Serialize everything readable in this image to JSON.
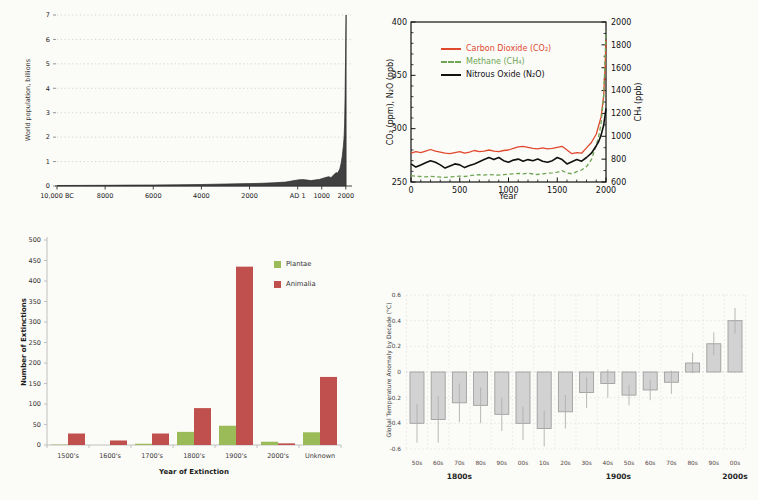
{
  "page_background": "#fbfbf8",
  "chart_data": [
    {
      "id": "population",
      "type": "area",
      "title": "",
      "ylabel": "World population, billions",
      "yticks": [
        0,
        1,
        2,
        3,
        4,
        5,
        6,
        7
      ],
      "ylim": [
        0,
        7
      ],
      "xlim": [
        -10000,
        2050
      ],
      "grid": "horizontal-dotted",
      "area_color": "#404040",
      "xticks": [
        {
          "year": -10000,
          "label": "10,000 BC"
        },
        {
          "year": -8000,
          "label": "8000"
        },
        {
          "year": -6000,
          "label": "6000"
        },
        {
          "year": -4000,
          "label": "4000"
        },
        {
          "year": -2000,
          "label": "2000"
        },
        {
          "year": 1,
          "label": "AD 1"
        },
        {
          "year": 1000,
          "label": "1000"
        },
        {
          "year": 2000,
          "label": "2000"
        }
      ],
      "points": [
        [
          -10000,
          0.02
        ],
        [
          -9000,
          0.025
        ],
        [
          -8000,
          0.03
        ],
        [
          -7000,
          0.035
        ],
        [
          -6000,
          0.04
        ],
        [
          -5000,
          0.05
        ],
        [
          -4000,
          0.06
        ],
        [
          -3000,
          0.08
        ],
        [
          -2000,
          0.1
        ],
        [
          -1500,
          0.11
        ],
        [
          -1000,
          0.13
        ],
        [
          -500,
          0.16
        ],
        [
          1,
          0.25
        ],
        [
          200,
          0.26
        ],
        [
          400,
          0.24
        ],
        [
          541,
          0.22
        ],
        [
          700,
          0.24
        ],
        [
          900,
          0.27
        ],
        [
          1000,
          0.3
        ],
        [
          1100,
          0.33
        ],
        [
          1200,
          0.36
        ],
        [
          1300,
          0.38
        ],
        [
          1350,
          0.35
        ],
        [
          1400,
          0.36
        ],
        [
          1500,
          0.46
        ],
        [
          1600,
          0.55
        ],
        [
          1650,
          0.52
        ],
        [
          1700,
          0.6
        ],
        [
          1750,
          0.7
        ],
        [
          1800,
          0.9
        ],
        [
          1850,
          1.2
        ],
        [
          1900,
          1.65
        ],
        [
          1930,
          2.0
        ],
        [
          1950,
          2.55
        ],
        [
          1970,
          3.7
        ],
        [
          1980,
          4.45
        ],
        [
          1990,
          5.3
        ],
        [
          2000,
          6.1
        ],
        [
          2011,
          7.0
        ]
      ]
    },
    {
      "id": "greenhouse",
      "type": "line",
      "title": "",
      "xlabel": "Year",
      "ylabel_left": "CO₂ (ppm), N₂O (ppb)",
      "ylabel_right": "CH₄ (ppb)",
      "left_axis": {
        "min": 250,
        "max": 400,
        "major": 50,
        "minor": 10
      },
      "right_axis": {
        "min": 600,
        "max": 2000,
        "major": 200,
        "minor": 100
      },
      "x_axis": {
        "min": 0,
        "max": 2000,
        "major": 500,
        "minor": 100
      },
      "legend_position": "upper-left-inside",
      "series": [
        {
          "name": "Carbon Dioxide (CO₂)",
          "color": "#e0492e",
          "axis": "left",
          "dash": null,
          "points": [
            [
              0,
              277
            ],
            [
              50,
              278.5
            ],
            [
              100,
              277.5
            ],
            [
              150,
              279
            ],
            [
              200,
              280.5
            ],
            [
              250,
              279
            ],
            [
              300,
              278
            ],
            [
              350,
              277
            ],
            [
              400,
              276.5
            ],
            [
              450,
              277.5
            ],
            [
              500,
              278.5
            ],
            [
              550,
              277
            ],
            [
              600,
              278
            ],
            [
              650,
              279.5
            ],
            [
              700,
              278.5
            ],
            [
              750,
              279
            ],
            [
              800,
              280
            ],
            [
              850,
              279
            ],
            [
              900,
              278.5
            ],
            [
              950,
              279.5
            ],
            [
              1000,
              280
            ],
            [
              1050,
              281.5
            ],
            [
              1100,
              283
            ],
            [
              1150,
              283.5
            ],
            [
              1200,
              282.5
            ],
            [
              1250,
              281.5
            ],
            [
              1300,
              281
            ],
            [
              1350,
              282
            ],
            [
              1400,
              281
            ],
            [
              1450,
              281.5
            ],
            [
              1500,
              282.5
            ],
            [
              1550,
              283.5
            ],
            [
              1600,
              280
            ],
            [
              1650,
              276.5
            ],
            [
              1700,
              277.5
            ],
            [
              1750,
              277
            ],
            [
              1800,
              282
            ],
            [
              1850,
              287
            ],
            [
              1900,
              295
            ],
            [
              1925,
              303
            ],
            [
              1950,
              311
            ],
            [
              1975,
              330
            ],
            [
              1990,
              355
            ],
            [
              2000,
              383
            ]
          ]
        },
        {
          "name": "Methane (CH₄)",
          "color": "#6fa654",
          "axis": "right",
          "dash": "4,2.6",
          "points": [
            [
              0,
              655
            ],
            [
              50,
              650
            ],
            [
              100,
              648
            ],
            [
              150,
              645
            ],
            [
              200,
              650
            ],
            [
              250,
              646
            ],
            [
              300,
              642
            ],
            [
              350,
              640
            ],
            [
              400,
              644
            ],
            [
              450,
              648
            ],
            [
              500,
              652
            ],
            [
              550,
              648
            ],
            [
              600,
              654
            ],
            [
              650,
              660
            ],
            [
              700,
              664
            ],
            [
              750,
              660
            ],
            [
              800,
              666
            ],
            [
              850,
              662
            ],
            [
              900,
              660
            ],
            [
              950,
              664
            ],
            [
              1000,
              668
            ],
            [
              1050,
              672
            ],
            [
              1100,
              676
            ],
            [
              1150,
              672
            ],
            [
              1200,
              678
            ],
            [
              1250,
              670
            ],
            [
              1300,
              666
            ],
            [
              1350,
              672
            ],
            [
              1400,
              676
            ],
            [
              1450,
              680
            ],
            [
              1500,
              686
            ],
            [
              1550,
              700
            ],
            [
              1600,
              678
            ],
            [
              1650,
              672
            ],
            [
              1700,
              690
            ],
            [
              1750,
              705
            ],
            [
              1800,
              735
            ],
            [
              1850,
              795
            ],
            [
              1900,
              925
            ],
            [
              1925,
              1000
            ],
            [
              1950,
              1110
            ],
            [
              1975,
              1350
            ],
            [
              1990,
              1650
            ],
            [
              2000,
              1920
            ]
          ]
        },
        {
          "name": "Nitrous Oxide (N₂O)",
          "color": "#111111",
          "axis": "left",
          "dash": null,
          "points": [
            [
              0,
              267
            ],
            [
              50,
              264
            ],
            [
              100,
              266
            ],
            [
              150,
              268
            ],
            [
              200,
              270
            ],
            [
              250,
              268.5
            ],
            [
              300,
              266
            ],
            [
              350,
              263
            ],
            [
              400,
              265
            ],
            [
              450,
              267
            ],
            [
              500,
              266
            ],
            [
              550,
              263.5
            ],
            [
              600,
              265.5
            ],
            [
              650,
              267
            ],
            [
              700,
              269
            ],
            [
              750,
              271
            ],
            [
              800,
              273
            ],
            [
              850,
              271
            ],
            [
              900,
              273
            ],
            [
              950,
              270
            ],
            [
              1000,
              268.5
            ],
            [
              1050,
              270.5
            ],
            [
              1100,
              271.5
            ],
            [
              1150,
              269.5
            ],
            [
              1200,
              271
            ],
            [
              1250,
              270
            ],
            [
              1300,
              271.5
            ],
            [
              1350,
              269.5
            ],
            [
              1400,
              268.5
            ],
            [
              1450,
              270
            ],
            [
              1500,
              273
            ],
            [
              1550,
              271
            ],
            [
              1600,
              267
            ],
            [
              1650,
              269
            ],
            [
              1700,
              271
            ],
            [
              1750,
              269.5
            ],
            [
              1800,
              273
            ],
            [
              1850,
              277
            ],
            [
              1900,
              284
            ],
            [
              1925,
              288
            ],
            [
              1950,
              294
            ],
            [
              1975,
              303
            ],
            [
              1990,
              312
            ],
            [
              2000,
              319
            ]
          ]
        }
      ]
    },
    {
      "id": "extinctions",
      "type": "bar",
      "title": "",
      "xlabel": "Year of Extinction",
      "ylabel": "Number of Extinctions",
      "ylim": [
        0,
        500
      ],
      "ytick_step": 50,
      "categories": [
        "1500's",
        "1600's",
        "1700's",
        "1800's",
        "1900's",
        "2000's",
        "Unknown"
      ],
      "series": [
        {
          "name": "Plantae",
          "color": "#9bbb59",
          "values": [
            1,
            0,
            3,
            32,
            47,
            8,
            31
          ]
        },
        {
          "name": "Animalia",
          "color": "#c0504d",
          "values": [
            28,
            11,
            28,
            90,
            435,
            4,
            166
          ]
        }
      ]
    },
    {
      "id": "temperature",
      "type": "bar",
      "title": "",
      "ylabel": "Global Temperature Anomaly by Decade (°C)",
      "ylim": [
        -0.6,
        0.6
      ],
      "yticks": [
        "0.6",
        "0.4",
        "0.2",
        "0",
        "-0.2",
        "-0.4",
        "-0.6"
      ],
      "decades": [
        "50s",
        "60s",
        "70s",
        "80s",
        "90s",
        "00s",
        "10s",
        "20s",
        "30s",
        "40s",
        "50s",
        "60s",
        "70s",
        "80s",
        "90s",
        "00s"
      ],
      "values": [
        -0.4,
        -0.37,
        -0.24,
        -0.26,
        -0.33,
        -0.4,
        -0.44,
        -0.31,
        -0.16,
        -0.09,
        -0.18,
        -0.14,
        -0.08,
        0.07,
        0.22,
        0.4
      ],
      "errors": [
        0.15,
        0.18,
        0.15,
        0.14,
        0.13,
        0.13,
        0.14,
        0.13,
        0.12,
        0.11,
        0.08,
        0.08,
        0.09,
        0.08,
        0.09,
        0.1
      ],
      "groups": [
        {
          "label": "1800s",
          "from": 0,
          "to": 4
        },
        {
          "label": "1900s",
          "from": 5,
          "to": 14
        },
        {
          "label": "2000s",
          "from": 15,
          "to": 15
        }
      ],
      "bar_fill": "#d2d2d2",
      "bar_stroke": "#9f9f9f",
      "error_color": "#b0b0b0",
      "grid": "dotted-both"
    }
  ]
}
